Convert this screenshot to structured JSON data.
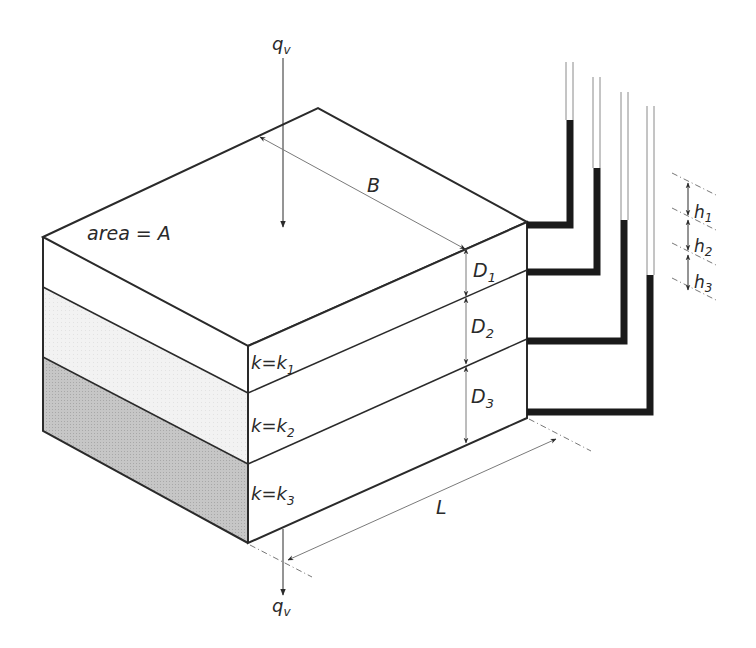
{
  "diagram": {
    "flow_in_label": "q",
    "flow_in_sub": "v",
    "flow_out_label": "q",
    "flow_out_sub": "v",
    "area_label": "area = A",
    "width_label": "B",
    "length_label": "L",
    "layers": [
      {
        "k_label": "k=k",
        "k_sub": "1",
        "d_label": "D",
        "d_sub": "1",
        "fill": "#ffffff"
      },
      {
        "k_label": "k=k",
        "k_sub": "2",
        "d_label": "D",
        "d_sub": "2",
        "fill": "#f0f0f0"
      },
      {
        "k_label": "k=k",
        "k_sub": "3",
        "d_label": "D",
        "d_sub": "3",
        "fill": "#c4c4c4"
      }
    ],
    "head_losses": [
      {
        "label": "h",
        "sub": "1"
      },
      {
        "label": "h",
        "sub": "2"
      },
      {
        "label": "h",
        "sub": "3"
      }
    ],
    "colors": {
      "line": "#2a2a2a",
      "dim_line": "#7a7a7a",
      "water": "#1a1a1a"
    }
  }
}
